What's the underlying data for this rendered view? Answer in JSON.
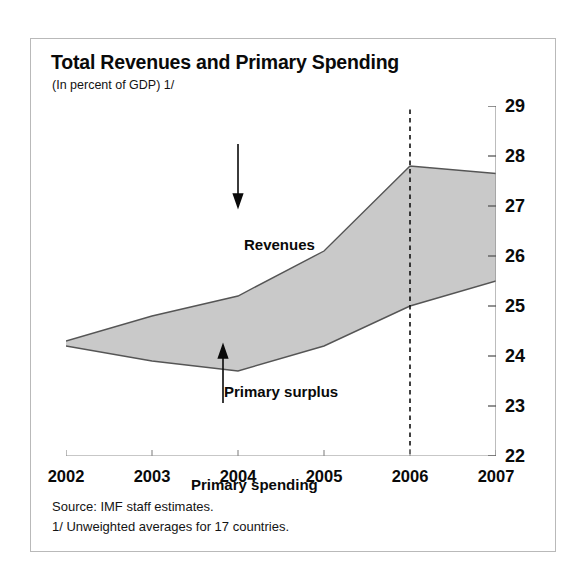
{
  "figure": {
    "title": "Total Revenues and Primary Spending",
    "subtitle": "(In percent of GDP) 1/",
    "source_note": "Source: IMF staff estimates.",
    "footnote": "1/ Unweighted averages for 17 countries.",
    "band_fill_color": "#c9c9c9",
    "band_line_color": "#555555",
    "frame_color": "#b9b9b9",
    "text_color": "#0a0a0a"
  },
  "chart_data": {
    "type": "area",
    "title": "Total Revenues and Primary Spending",
    "subtitle": "(In percent of GDP) 1/",
    "xlabel": "",
    "ylabel": "",
    "x": [
      2002,
      2003,
      2004,
      2005,
      2006,
      2007
    ],
    "xlim": [
      2002,
      2007
    ],
    "ylim": [
      22,
      29
    ],
    "yticks": [
      22,
      23,
      24,
      25,
      26,
      27,
      28,
      29
    ],
    "xticks": [
      2002,
      2003,
      2004,
      2005,
      2006,
      2007
    ],
    "xticklabels": [
      "2002",
      "2003",
      "2004",
      "2005",
      "2006",
      "2007"
    ],
    "yticklabels": [
      "22",
      "23",
      "24",
      "25",
      "26",
      "27",
      "28",
      "29"
    ],
    "y_axis_position": "right",
    "grid": false,
    "legend": "annotations-inline",
    "series": [
      {
        "name": "Revenues",
        "values": [
          24.3,
          24.8,
          25.2,
          26.1,
          27.8,
          27.65
        ]
      },
      {
        "name": "Primary spending",
        "values": [
          24.2,
          23.9,
          23.7,
          24.2,
          25.0,
          25.5
        ]
      }
    ],
    "fill_between": {
      "label": "Primary surplus",
      "upper_series": "Revenues",
      "lower_series": "Primary spending",
      "color": "#c9c9c9"
    },
    "annotations": [
      {
        "text": "Revenues",
        "x": 2004.55,
        "y": 27.15,
        "arrow": "down"
      },
      {
        "text": "Primary surplus",
        "x": 2004.25,
        "y": 24.75,
        "arrow": "none"
      },
      {
        "text": "Primary spending",
        "x": 2004.1,
        "y": 23.1,
        "arrow": "up"
      }
    ],
    "vertical_marker": {
      "x": 2006,
      "style": "dashed",
      "meaning": "projection-start"
    }
  },
  "y_axis": {
    "ticks": [
      {
        "label": "29",
        "value": 29
      },
      {
        "label": "28",
        "value": 28
      },
      {
        "label": "27",
        "value": 27
      },
      {
        "label": "26",
        "value": 26
      },
      {
        "label": "25",
        "value": 25
      },
      {
        "label": "24",
        "value": 24
      },
      {
        "label": "23",
        "value": 23
      },
      {
        "label": "22",
        "value": 22
      }
    ]
  },
  "x_axis": {
    "ticks": [
      {
        "label": "2002",
        "value": 2002
      },
      {
        "label": "2003",
        "value": 2003
      },
      {
        "label": "2004",
        "value": 2004
      },
      {
        "label": "2005",
        "value": 2005
      },
      {
        "label": "2006",
        "value": 2006
      },
      {
        "label": "2007",
        "value": 2007
      }
    ]
  },
  "annotations": {
    "revenues": "Revenues",
    "primary_surplus": "Primary surplus",
    "primary_spending": "Primary spending"
  }
}
